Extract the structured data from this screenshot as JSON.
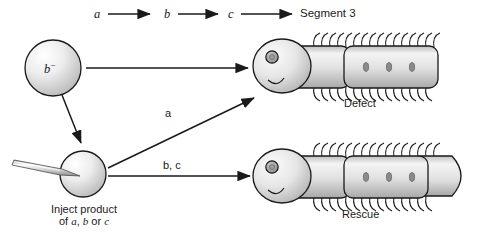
{
  "diagram": {
    "pathway": {
      "nodes": [
        {
          "id": "a",
          "label": "a",
          "style": "italic"
        },
        {
          "id": "b",
          "label": "b",
          "style": "italic"
        },
        {
          "id": "c",
          "label": "c",
          "style": "italic"
        },
        {
          "id": "segment3",
          "label": "Segment 3",
          "style": "roman"
        }
      ],
      "arrows": [
        "a-to-b",
        "b-to-c",
        "c-to-segment3"
      ]
    },
    "cells": [
      {
        "id": "mutant-cell",
        "label_html": "b",
        "superscript": "−",
        "description": "mutant b-minus cell"
      },
      {
        "id": "injected-cell",
        "caption_line1": "Inject product",
        "caption_line2_pre": "of ",
        "caption_line2_a": "a",
        "caption_line2_mid": ", ",
        "caption_line2_b": "b",
        "caption_line2_or": " or ",
        "caption_line2_c": "c",
        "description": "cell being injected by micropipette"
      }
    ],
    "arrows": [
      {
        "id": "mutant-to-defect",
        "label": "",
        "from": "mutant-cell",
        "to": "defect-larva"
      },
      {
        "id": "inject-to-defect",
        "label": "a",
        "from": "injected-cell",
        "to": "defect-larva"
      },
      {
        "id": "inject-to-rescue",
        "label": "b, c",
        "from": "injected-cell",
        "to": "rescue-larva"
      }
    ],
    "outcomes": [
      {
        "id": "defect-larva",
        "label": "Defect",
        "tail": "truncated",
        "spiracles": 3
      },
      {
        "id": "rescue-larva",
        "label": "Rescue",
        "tail": "pointed",
        "spiracles": 3
      }
    ],
    "colors": {
      "stroke": "#1a1a1a",
      "body_light": "#f2f2f2",
      "body_mid": "#d8d8d8",
      "body_dark": "#a8a8a8",
      "spiracle": "#8a8a8a",
      "background": "#ffffff"
    }
  }
}
